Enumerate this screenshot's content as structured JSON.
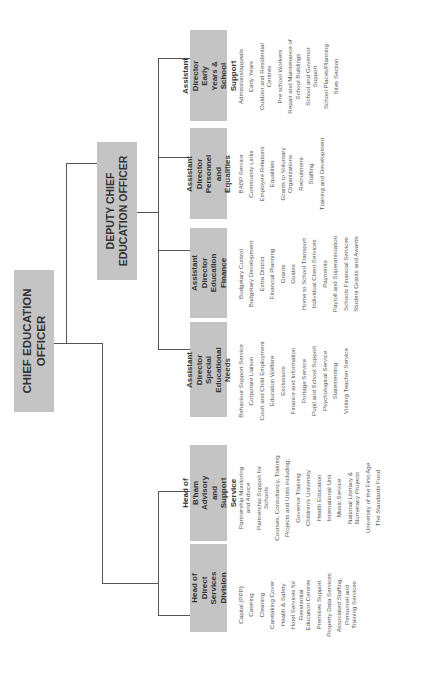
{
  "chief": {
    "title": "CHIEF EDUCATION OFFICER"
  },
  "deputy": {
    "title": "DEPUTY CHIEF EDUCATION OFFICER"
  },
  "departments": [
    {
      "title": "Assistant Director\nEarly Years & School\nSupport",
      "items": [
        "Admissions/appeals",
        "Early Years",
        "Outdoor and Residential\nCentres",
        "Pre school Workers",
        "Repair and Maintenance of\nSchool Buildings",
        "School and Governor\nSupport",
        "School Places/Planning",
        "Sites Section"
      ]
    },
    {
      "title": "Assistant Director\nPersonnel and\nEqualities",
      "items": [
        "BABP Service",
        "Community Links",
        "Employee Relations",
        "Equalities",
        "Grants to Voluntary\nOrganizations",
        "Recruitment",
        "Staffing",
        "Training and Development"
      ]
    },
    {
      "title": "Assistant Director\nEducation Finance",
      "items": [
        "Budgetary Control",
        "Budgetary Development",
        "Extra District",
        "Financial Planning",
        "Grants",
        "Guides",
        "Home to School Transport",
        "Individual Client Services",
        "Payments",
        "Payroll and Superannuation",
        "Schools Financial Services",
        "Student Grants and Awards"
      ]
    },
    {
      "title": "Assistant Director\nSpecial Educational\nNeeds",
      "items": [
        "Behaviour Support Service",
        "Corporate Liaison",
        "Court and Child Employment",
        "Education Welfare",
        "Exclusions",
        "Finance and Information",
        "Portage Service",
        "Pupil and School Support",
        "Psychological Service",
        "Statementing",
        "Visiting Teacher Service"
      ]
    },
    {
      "title": "Head of\nB'ham Advisory and\nSupport Service",
      "items": [
        "Partnership Monitoring\nand Advice",
        "Partnership Support for\nSchools",
        "Courses, Consultancy, Training",
        "Projects and Units including;",
        "Governor Training",
        "Children's University",
        "Health Education",
        "International Unit",
        "Music Service",
        "National Literacy &\nNumeracy Projects",
        "University of the First Age",
        "The Standards Fund"
      ]
    },
    {
      "title": "Head of\nDirect Services\nDivision",
      "items": [
        "Capital (PPP)",
        "Catering",
        "Cleaning",
        "Caretaking Cover",
        "Health & Safety",
        "Hotel Services for\nResidential\nEducation Centres",
        "Premises Support",
        "Property Data Services",
        "Associated Staffing,\nPersonnel and\nTraining Services"
      ]
    },
    {
      "title": "Assistant Director\nManagement and\nCo-ordination",
      "items": [
        "Assessment Unit",
        "Committee and Member\nServices",
        "Education Information\nTechnology",
        "Central Administration",
        "IT Training",
        "Martineau Centre – Site\nManagement",
        "Office Accommodation",
        "Performance Data",
        "Policy Co-ordination",
        "Public Relations and Media\nServices",
        "Research and Statistics",
        "SRB and LILA Co-ordination",
        "Support for CEO/Chair"
      ]
    }
  ],
  "colors": {
    "box_fill": "#c4c4c4",
    "line": "#555555",
    "text": "#333333"
  }
}
